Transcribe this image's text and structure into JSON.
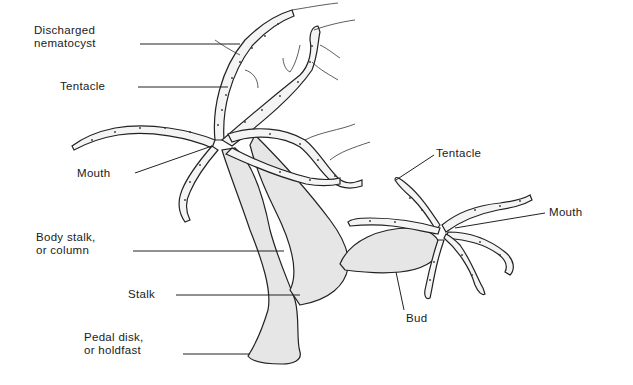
{
  "diagram": {
    "labels": {
      "discharged_nematocyst": [
        "Discharged",
        "nematocyst"
      ],
      "tentacle_parent": "Tentacle",
      "mouth_parent": "Mouth",
      "body_stalk": [
        "Body stalk,",
        "or column"
      ],
      "stalk": "Stalk",
      "pedal_disk": [
        "Pedal disk,",
        "or holdfast"
      ],
      "tentacle_bud": "Tentacle",
      "mouth_bud": "Mouth",
      "bud": "Bud"
    }
  }
}
